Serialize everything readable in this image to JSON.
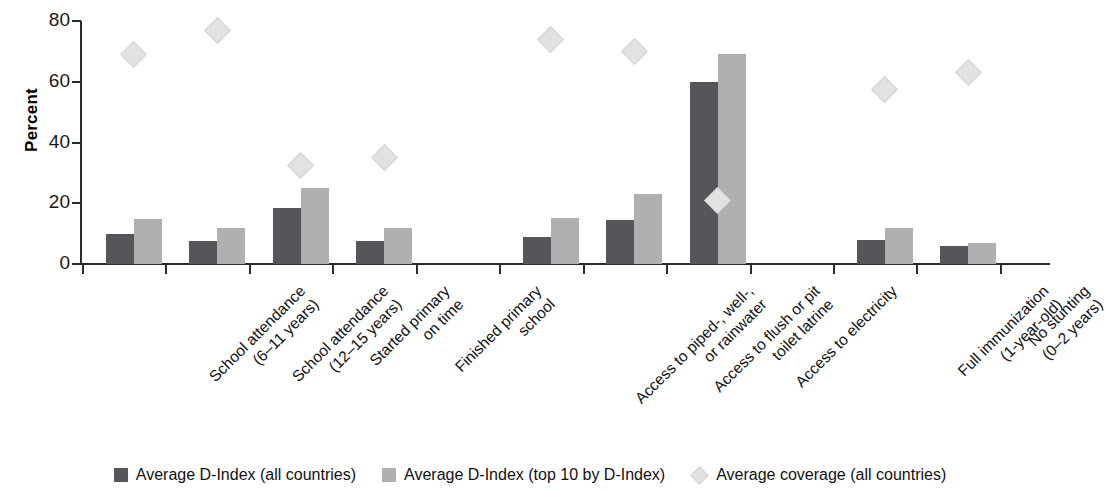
{
  "chart_data": {
    "type": "bar",
    "title": "",
    "xlabel": "",
    "ylabel": "Percent",
    "ylim": [
      0,
      80
    ],
    "yticks": [
      0,
      20,
      40,
      60,
      80
    ],
    "grid": false,
    "legend_position": "bottom",
    "categories": [
      "School attendance\n(6–11 years)",
      "School attendance\n(12–15 years)",
      "Started primary\non time",
      "Finished primary\nschool",
      "Access to piped-, well-,\nor rainwater",
      "Access to flush or pit\ntoilet latrine",
      "Access to electricity",
      "Full immunization\n(1-year-old)",
      "No stunting\n(0–2 years)"
    ],
    "category_lines": [
      [
        "School attendance",
        "(6–11 years)"
      ],
      [
        "School attendance",
        "(12–15 years)"
      ],
      [
        "Started primary",
        "on time"
      ],
      [
        "Finished primary",
        "school"
      ],
      [
        "Access to piped-, well-,",
        "or rainwater"
      ],
      [
        "Access to flush or pit",
        "toilet latrine"
      ],
      [
        "Access to electricity"
      ],
      [
        "Full immunization",
        "(1-year-old)"
      ],
      [
        "No stunting",
        "(0–2 years)"
      ]
    ],
    "series": [
      {
        "name": "Average D-Index (all countries)",
        "type": "bar",
        "color": "#56565a",
        "values": [
          10,
          7.5,
          18.5,
          7.5,
          9,
          14.5,
          60,
          8,
          6
        ]
      },
      {
        "name": "Average D-Index (top 10 by D-Index)",
        "type": "bar",
        "color": "#b0b0b0",
        "values": [
          14.8,
          11.7,
          25,
          11.8,
          15.2,
          23,
          69,
          12,
          7
        ]
      },
      {
        "name": "Average coverage (all countries)",
        "type": "marker",
        "marker": "diamond",
        "color": "#e2e2e2",
        "values": [
          69,
          77,
          32.5,
          35,
          74,
          70,
          21,
          57.5,
          63
        ]
      }
    ]
  },
  "legend": {
    "items": [
      {
        "label": "Average D-Index (all countries)",
        "marker": "square-dark",
        "color": "#56565a"
      },
      {
        "label": "Average D-Index (top 10 by D-Index)",
        "marker": "square-light",
        "color": "#b0b0b0"
      },
      {
        "label": "Average coverage (all countries)",
        "marker": "diamond",
        "color": "#e2e2e2"
      }
    ]
  },
  "axis": {
    "y_title": "Percent",
    "y_tick_labels": [
      "0",
      "20",
      "40",
      "60",
      "80"
    ]
  }
}
